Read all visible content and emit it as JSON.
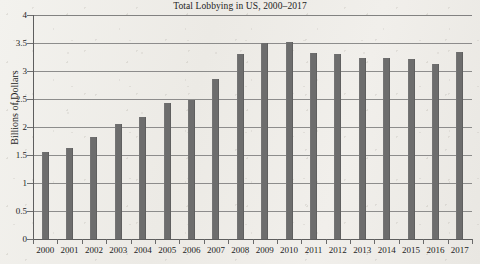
{
  "chart_data": {
    "type": "bar",
    "title": "Total Lobbying in US, 2000–2017",
    "xlabel": "",
    "ylabel": "Billions of Dollars",
    "categories": [
      "2000",
      "2001",
      "2002",
      "2003",
      "2004",
      "2005",
      "2006",
      "2007",
      "2008",
      "2009",
      "2010",
      "2011",
      "2012",
      "2013",
      "2014",
      "2015",
      "2016",
      "2017"
    ],
    "values": [
      1.56,
      1.63,
      1.82,
      2.06,
      2.18,
      2.43,
      2.48,
      2.85,
      3.3,
      3.5,
      3.51,
      3.32,
      3.3,
      3.24,
      3.23,
      3.22,
      3.12,
      3.34
    ],
    "ylim": [
      0,
      4
    ],
    "y_ticks": [
      "0",
      "0.5",
      "1",
      "1.5",
      "2",
      "2.5",
      "3",
      "3.5",
      "4"
    ],
    "y_tick_values": [
      0,
      0.5,
      1,
      1.5,
      2,
      2.5,
      3,
      3.5,
      4
    ],
    "grid": true,
    "legend": "none",
    "bar_color": "#6d6d6d",
    "grid_color": "#7b7b7b",
    "background_color": "#efeeea"
  }
}
